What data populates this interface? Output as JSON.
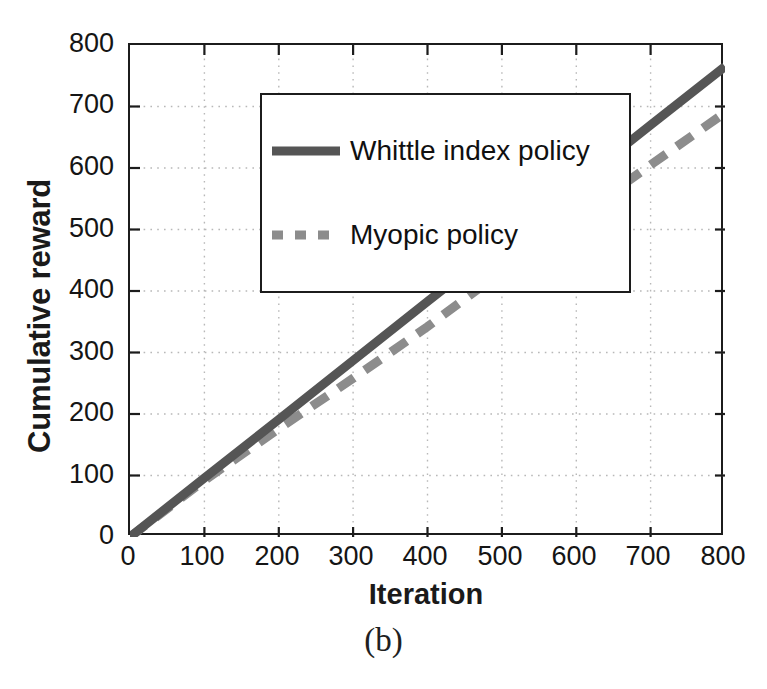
{
  "figure": {
    "caption": "(b)",
    "xlabel": "Iteration",
    "ylabel": "Cumulative reward"
  },
  "legend": {
    "position": "top-left-inside",
    "entries": [
      {
        "label": "Whittle index policy",
        "style": "solid",
        "color": "#555555",
        "sample_name": "solid-line-swatch"
      },
      {
        "label": "Myopic policy",
        "style": "dashed",
        "color": "#8c8c8c",
        "sample_name": "dashed-line-swatch"
      }
    ]
  },
  "axes": {
    "x_ticks": [
      "0",
      "100",
      "200",
      "300",
      "400",
      "500",
      "600",
      "700",
      "800"
    ],
    "y_ticks": [
      "0",
      "100",
      "200",
      "300",
      "400",
      "500",
      "600",
      "700",
      "800"
    ]
  },
  "colors": {
    "whittle": "#555555",
    "myopic": "#8c8c8c",
    "axis": "#1c1c1c",
    "grid": "#b8b8b8",
    "text": "#151515",
    "background": "#ffffff"
  },
  "chart_data": {
    "type": "line",
    "title": "",
    "subtitle": "",
    "xlabel": "Iteration",
    "ylabel": "Cumulative reward",
    "xlim": [
      0,
      800
    ],
    "ylim": [
      0,
      800
    ],
    "xticks": [
      0,
      100,
      200,
      300,
      400,
      500,
      600,
      700,
      800
    ],
    "yticks": [
      0,
      100,
      200,
      300,
      400,
      500,
      600,
      700,
      800
    ],
    "grid": true,
    "grid_style": "dotted",
    "legend": [
      "Whittle index policy",
      "Myopic policy"
    ],
    "legend_position": "upper left",
    "annotations": [
      "(b)"
    ],
    "x": [
      0,
      100,
      200,
      300,
      400,
      500,
      600,
      700,
      800
    ],
    "series": [
      {
        "name": "Whittle index policy",
        "style": "solid",
        "color": "#555555",
        "values": [
          0,
          96,
          191,
          287,
          383,
          478,
          574,
          670,
          765
        ]
      },
      {
        "name": "Myopic policy",
        "style": "dashed",
        "color": "#8c8c8c",
        "values": [
          0,
          92,
          176,
          258,
          342,
          432,
          519,
          605,
          690
        ]
      }
    ]
  }
}
